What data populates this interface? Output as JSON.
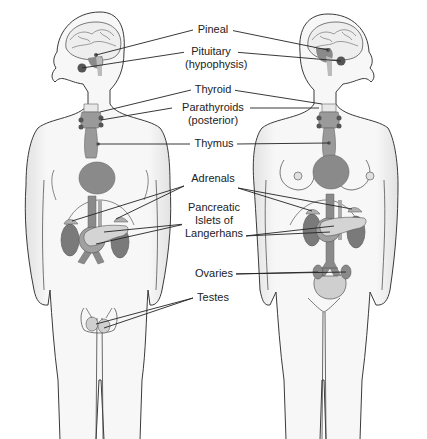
{
  "diagram": {
    "figures": [
      "male-figure",
      "female-figure"
    ],
    "colors": {
      "skin_fill": "#f4f4f4",
      "outline": "#3a3a3a",
      "gland_dark": "#7a7a7a",
      "gland_mid": "#9a9a9a",
      "gland_light": "#c8c8c8",
      "leader_line": "#222222",
      "text": "#222222"
    },
    "labels": [
      {
        "id": "pineal",
        "lines": [
          "Pineal"
        ]
      },
      {
        "id": "pituitary",
        "lines": [
          "Pituitary",
          "(hypophysis)"
        ]
      },
      {
        "id": "thyroid",
        "lines": [
          "Thyroid"
        ]
      },
      {
        "id": "parathyroids",
        "lines": [
          "Parathyroids",
          "(posterior)"
        ]
      },
      {
        "id": "thymus",
        "lines": [
          "Thymus"
        ]
      },
      {
        "id": "adrenals",
        "lines": [
          "Adrenals"
        ]
      },
      {
        "id": "pancreatic-islets",
        "lines": [
          "Pancreatic",
          "Islets of",
          "Langerhans"
        ]
      },
      {
        "id": "ovaries",
        "lines": [
          "Ovaries"
        ]
      },
      {
        "id": "testes",
        "lines": [
          "Testes"
        ]
      }
    ]
  }
}
